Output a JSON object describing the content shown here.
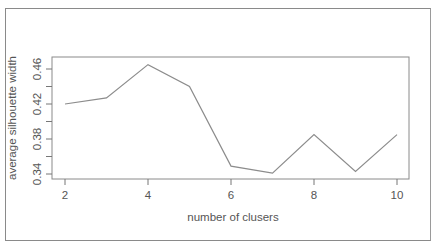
{
  "chart_data": {
    "type": "line",
    "title": "",
    "xlabel": "number of clusers",
    "ylabel": "average silhouette width",
    "x": [
      2,
      3,
      4,
      5,
      6,
      7,
      8,
      9,
      10
    ],
    "series": [
      {
        "name": "average silhouette width",
        "values": [
          0.42,
          0.427,
          0.465,
          0.44,
          0.349,
          0.341,
          0.385,
          0.343,
          0.385
        ]
      }
    ],
    "xticks": [
      2,
      4,
      6,
      8,
      10
    ],
    "yticks": [
      0.34,
      0.36,
      0.38,
      0.4,
      0.42,
      0.44,
      0.46
    ],
    "ytick_labels": [
      "0.34",
      "0.38",
      "0.42",
      "0.46"
    ],
    "xlim": [
      2,
      10
    ],
    "ylim": [
      0.34,
      0.465
    ],
    "grid": false,
    "legend": null,
    "line_color": "#8c8c8c"
  },
  "labels": {
    "xlabel": "number of clusers",
    "ylabel": "average silhouette width",
    "xticks": [
      "2",
      "4",
      "6",
      "8",
      "10"
    ],
    "yticks": [
      "0.34",
      "0.38",
      "0.42",
      "0.46"
    ]
  }
}
